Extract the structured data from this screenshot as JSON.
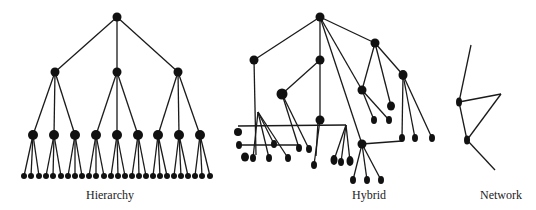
{
  "figure": {
    "labels": {
      "hierarchy": "Hierarchy",
      "hybrid": "Hybrid",
      "network": "Network"
    },
    "colors": {
      "node": "#111111",
      "edge": "#1a1a1a",
      "background": "#ffffff"
    }
  },
  "diagrams": {
    "hierarchy": {
      "nodes": [
        {
          "id": "r",
          "x": 117,
          "y": 17,
          "r": 4.5
        },
        {
          "id": "a",
          "x": 55,
          "y": 72,
          "r": 4.5
        },
        {
          "id": "b",
          "x": 117,
          "y": 72,
          "r": 4.5
        },
        {
          "id": "c",
          "x": 178,
          "y": 72,
          "r": 4.5
        },
        {
          "id": "a1",
          "x": 33,
          "y": 135,
          "r": 5
        },
        {
          "id": "a2",
          "x": 54,
          "y": 135,
          "r": 5
        },
        {
          "id": "a3",
          "x": 75,
          "y": 135,
          "r": 5
        },
        {
          "id": "b1",
          "x": 96,
          "y": 135,
          "r": 5
        },
        {
          "id": "b2",
          "x": 117,
          "y": 135,
          "r": 5
        },
        {
          "id": "b3",
          "x": 138,
          "y": 135,
          "r": 5
        },
        {
          "id": "c1",
          "x": 158,
          "y": 135,
          "r": 5
        },
        {
          "id": "c2",
          "x": 179,
          "y": 135,
          "r": 5
        },
        {
          "id": "c3",
          "x": 200,
          "y": 135,
          "r": 5
        }
      ],
      "leaf_y": 176,
      "leaf_r": 3,
      "leaf_groups": [
        {
          "parent": "a1",
          "xs": [
            24,
            31,
            39
          ]
        },
        {
          "parent": "a2",
          "xs": [
            46,
            53,
            61
          ]
        },
        {
          "parent": "a3",
          "xs": [
            68,
            75,
            82
          ]
        },
        {
          "parent": "b1",
          "xs": [
            89,
            96,
            104
          ]
        },
        {
          "parent": "b2",
          "xs": [
            111,
            118,
            125
          ]
        },
        {
          "parent": "b3",
          "xs": [
            132,
            139,
            146
          ]
        },
        {
          "parent": "c1",
          "xs": [
            153,
            160,
            167
          ]
        },
        {
          "parent": "c2",
          "xs": [
            174,
            181,
            188
          ]
        },
        {
          "parent": "c3",
          "xs": [
            195,
            202,
            210
          ]
        }
      ],
      "edges": [
        [
          "r",
          "a"
        ],
        [
          "r",
          "b"
        ],
        [
          "r",
          "c"
        ],
        [
          "a",
          "a1"
        ],
        [
          "a",
          "a2"
        ],
        [
          "a",
          "a3"
        ],
        [
          "b",
          "b1"
        ],
        [
          "b",
          "b2"
        ],
        [
          "b",
          "b3"
        ],
        [
          "c",
          "c1"
        ],
        [
          "c",
          "c2"
        ],
        [
          "c",
          "c3"
        ]
      ]
    },
    "hybrid": {
      "nodes": [
        {
          "id": "root",
          "x": 320,
          "y": 17,
          "rx": 4.5,
          "ry": 4.5
        },
        {
          "id": "A",
          "x": 254,
          "y": 60,
          "rx": 4.5,
          "ry": 4.5
        },
        {
          "id": "B",
          "x": 320,
          "y": 60,
          "rx": 4.5,
          "ry": 4.5
        },
        {
          "id": "C",
          "x": 375,
          "y": 43,
          "rx": 4.5,
          "ry": 4.5
        },
        {
          "id": "D",
          "x": 403,
          "y": 75,
          "rx": 4.5,
          "ry": 5
        },
        {
          "id": "E",
          "x": 282,
          "y": 94,
          "rx": 5.5,
          "ry": 5.5
        },
        {
          "id": "F",
          "x": 362,
          "y": 90,
          "rx": 4.5,
          "ry": 4.5
        },
        {
          "id": "G",
          "x": 391,
          "y": 106,
          "rx": 4,
          "ry": 4.5
        },
        {
          "id": "H",
          "x": 320,
          "y": 120,
          "rx": 4.5,
          "ry": 4.5
        },
        {
          "id": "I",
          "x": 362,
          "y": 144,
          "rx": 4.5,
          "ry": 4.5
        },
        {
          "id": "F1",
          "x": 374,
          "y": 120,
          "rx": 3,
          "ry": 4
        },
        {
          "id": "F2",
          "x": 389,
          "y": 120,
          "rx": 3,
          "ry": 4
        },
        {
          "id": "D1",
          "x": 402,
          "y": 138,
          "rx": 3,
          "ry": 4
        },
        {
          "id": "D2",
          "x": 415,
          "y": 138,
          "rx": 3,
          "ry": 4
        },
        {
          "id": "D3",
          "x": 432,
          "y": 138,
          "rx": 3,
          "ry": 4
        },
        {
          "id": "I1",
          "x": 353,
          "y": 180,
          "rx": 3,
          "ry": 4
        },
        {
          "id": "I2",
          "x": 367,
          "y": 180,
          "rx": 3,
          "ry": 4
        },
        {
          "id": "I3",
          "x": 381,
          "y": 180,
          "rx": 3,
          "ry": 4
        },
        {
          "id": "L1",
          "x": 238,
          "y": 132,
          "rx": 4,
          "ry": 4
        },
        {
          "id": "L2",
          "x": 239,
          "y": 145,
          "rx": 3,
          "ry": 4
        },
        {
          "id": "L3",
          "x": 274,
          "y": 144,
          "rx": 3,
          "ry": 4
        },
        {
          "id": "L4",
          "x": 299,
          "y": 148,
          "rx": 3,
          "ry": 4
        },
        {
          "id": "L5",
          "x": 309,
          "y": 149,
          "rx": 3,
          "ry": 4
        },
        {
          "id": "L6",
          "x": 245,
          "y": 157,
          "rx": 4,
          "ry": 4.5
        },
        {
          "id": "L7",
          "x": 253,
          "y": 158,
          "rx": 3,
          "ry": 4
        },
        {
          "id": "L8",
          "x": 269,
          "y": 158,
          "rx": 3,
          "ry": 4
        },
        {
          "id": "L9",
          "x": 288,
          "y": 158,
          "rx": 3,
          "ry": 4
        },
        {
          "id": "L10",
          "x": 314,
          "y": 165,
          "rx": 3,
          "ry": 4
        },
        {
          "id": "M1",
          "x": 334,
          "y": 160,
          "rx": 3.5,
          "ry": 5
        },
        {
          "id": "M2",
          "x": 341,
          "y": 162,
          "rx": 3,
          "ry": 4
        },
        {
          "id": "M3",
          "x": 350,
          "y": 161,
          "rx": 3.5,
          "ry": 5
        }
      ],
      "edges": [
        [
          "root",
          "A"
        ],
        [
          "root",
          "B"
        ],
        [
          "root",
          "C"
        ],
        [
          "root",
          "F"
        ],
        [
          "root",
          "I"
        ],
        [
          "C",
          "F"
        ],
        [
          "C",
          "D"
        ],
        [
          "C",
          "G"
        ],
        [
          "F",
          "F1"
        ],
        [
          "F",
          "F2"
        ],
        [
          "D",
          "D1"
        ],
        [
          "D",
          "D2"
        ],
        [
          "D",
          "D3"
        ],
        [
          "B",
          "E"
        ],
        [
          "B",
          "H"
        ],
        [
          "E",
          "L4"
        ],
        [
          "E",
          "L5"
        ],
        [
          "H",
          "L10"
        ],
        [
          "I",
          "I1"
        ],
        [
          "I",
          "I2"
        ],
        [
          "I",
          "I3"
        ]
      ],
      "polylines": [
        [
          [
            254,
            60
          ],
          [
            256,
            155
          ]
        ],
        [
          [
            258,
            112
          ],
          [
            288,
            158
          ]
        ],
        [
          [
            258,
            112
          ],
          [
            269,
            158
          ]
        ],
        [
          [
            258,
            112
          ],
          [
            274,
            144
          ]
        ],
        [
          [
            258,
            112
          ],
          [
            253,
            158
          ]
        ],
        [
          [
            238,
            126
          ],
          [
            346,
            125
          ]
        ],
        [
          [
            239,
            145
          ],
          [
            299,
            145
          ]
        ],
        [
          [
            346,
            125
          ],
          [
            334,
            160
          ]
        ],
        [
          [
            346,
            125
          ],
          [
            341,
            162
          ]
        ],
        [
          [
            346,
            125
          ],
          [
            350,
            161
          ]
        ],
        [
          [
            318,
            122
          ],
          [
            316,
            156
          ]
        ],
        [
          [
            362,
            144
          ],
          [
            402,
            141
          ]
        ]
      ]
    },
    "network": {
      "nodes": [
        {
          "id": "n1",
          "x": 459,
          "y": 102,
          "rx": 3,
          "ry": 4.5
        },
        {
          "id": "n2",
          "x": 467,
          "y": 140,
          "rx": 3,
          "ry": 4.5
        }
      ],
      "segments": [
        [
          [
            471,
            45
          ],
          [
            459,
            102
          ]
        ],
        [
          [
            459,
            102
          ],
          [
            501,
            94
          ]
        ],
        [
          [
            501,
            94
          ],
          [
            467,
            140
          ]
        ],
        [
          [
            459,
            102
          ],
          [
            467,
            140
          ]
        ],
        [
          [
            467,
            140
          ],
          [
            495,
            170
          ]
        ]
      ]
    }
  }
}
